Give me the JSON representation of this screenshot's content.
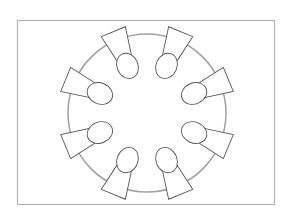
{
  "diagram": {
    "type": "seating-plan-top-view",
    "frame": {
      "x": 17,
      "y": 20,
      "width": 257,
      "height": 184,
      "stroke": "#b4b4b4"
    },
    "table": {
      "shape": "round",
      "cx": 147,
      "cy": 113,
      "r": 79,
      "stroke": "#a0a0a0",
      "stroke_width": 1.5
    },
    "seat_count": 8,
    "seats": [
      {
        "id": "seat-1",
        "angle": -112.5
      },
      {
        "id": "seat-2",
        "angle": -67.5
      },
      {
        "id": "seat-3",
        "angle": -22.5
      },
      {
        "id": "seat-4",
        "angle": 22.5
      },
      {
        "id": "seat-5",
        "angle": 67.5
      },
      {
        "id": "seat-6",
        "angle": 112.5
      },
      {
        "id": "seat-7",
        "angle": 157.5
      },
      {
        "id": "seat-8",
        "angle": -157.5
      }
    ],
    "person_style": {
      "stroke": "#555555",
      "fill": "#ffffff"
    }
  }
}
